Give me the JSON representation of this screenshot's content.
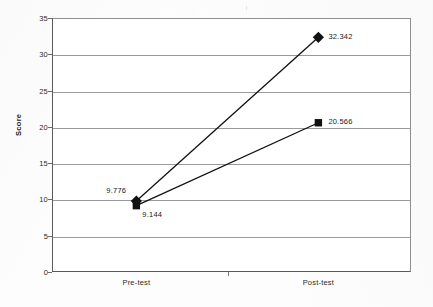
{
  "chart_data": {
    "type": "line",
    "title": "",
    "subtitle": "",
    "xlabel": "",
    "ylabel": "Score",
    "categories": [
      "Pre-test",
      "Post-test"
    ],
    "x": [
      0,
      1
    ],
    "ylim": [
      0,
      35
    ],
    "y_ticks": [
      0,
      5,
      10,
      15,
      20,
      25,
      30,
      35
    ],
    "y_tick_labels": [
      "0",
      "5",
      "10",
      "15",
      "20",
      "25",
      "30",
      "35"
    ],
    "grid": "horizontal",
    "legend": "none",
    "series": [
      {
        "name": "diamond-series",
        "marker": "diamond",
        "color": "#111111",
        "values": [
          9.776,
          32.342
        ],
        "data_labels": [
          "9.776",
          "32.342"
        ]
      },
      {
        "name": "square-series",
        "marker": "square",
        "color": "#111111",
        "values": [
          9.144,
          20.566
        ],
        "data_labels": [
          "9.144",
          "20.566"
        ]
      }
    ],
    "annotations": [
      {
        "text": "9.776",
        "series": "diamond-series",
        "point": "Pre-test"
      },
      {
        "text": "32.342",
        "series": "diamond-series",
        "point": "Post-test"
      },
      {
        "text": "9.144",
        "series": "square-series",
        "point": "Pre-test"
      },
      {
        "text": "20.566",
        "series": "square-series",
        "point": "Post-test"
      }
    ]
  },
  "axes": {
    "y_title": "Score",
    "y_labels": [
      "35",
      "30",
      "25",
      "20",
      "15",
      "10",
      "5",
      "0"
    ],
    "x_labels": [
      "Pre-test",
      "Post-test"
    ]
  },
  "labels": {
    "diamond_pre": "9.776",
    "diamond_post": "32.342",
    "square_pre": "9.144",
    "square_post": "20.566"
  },
  "colors": {
    "series": "#111111",
    "axis": "#5a5a5a",
    "grid": "#9a9a9a",
    "text": "#1a1a1a",
    "background": "#ffffff"
  }
}
